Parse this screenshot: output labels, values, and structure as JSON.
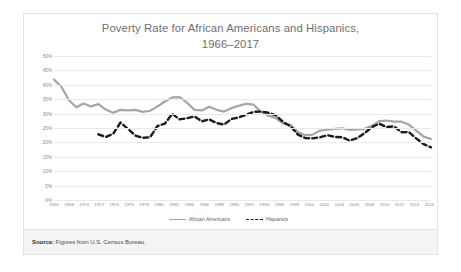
{
  "figure": {
    "title_line1": "Poverty Rate for African Americans and Hispanics,",
    "title_line2": "1966–2017",
    "source_label": "Source:",
    "source_text": " Figures from U.S. Census Bureau."
  },
  "colors": {
    "african_american_line": "#a6a6a6",
    "hispanic_line": "#1a1a1a",
    "gridline": "#e9e9e9",
    "axis_text": "#8a8a8a",
    "title_text": "#6f6f6f",
    "card_border": "#e3e3e3",
    "source_bar_bg": "#f4f4f4"
  },
  "chart_data": {
    "type": "line",
    "title": "Poverty Rate for African Americans and Hispanics, 1966–2017",
    "xlabel": "",
    "ylabel": "",
    "ylim": [
      0,
      50
    ],
    "yticks": [
      0,
      5,
      10,
      15,
      20,
      25,
      30,
      35,
      40,
      45,
      50
    ],
    "ytick_labels": [
      "0%",
      "5%",
      "10%",
      "15%",
      "20%",
      "25%",
      "30%",
      "35%",
      "40%",
      "45%",
      "50%"
    ],
    "xlim": [
      1966,
      2017
    ],
    "xticks": [
      1966,
      1968,
      1970,
      1972,
      1974,
      1976,
      1978,
      1980,
      1982,
      1984,
      1986,
      1988,
      1990,
      1992,
      1994,
      1996,
      1998,
      2000,
      2002,
      2004,
      2006,
      2008,
      2010,
      2012,
      2014,
      2016
    ],
    "xtick_labels": [
      "1966",
      "1968",
      "1970",
      "1972",
      "1974",
      "1976",
      "1978",
      "1980",
      "1982",
      "1984",
      "1986",
      "1988",
      "1990",
      "1992",
      "1994",
      "1996",
      "1998",
      "2000",
      "2002",
      "2004",
      "2006",
      "2008",
      "2010",
      "2012",
      "2014",
      "2016"
    ],
    "grid": true,
    "legend_position": "bottom",
    "series": [
      {
        "name": "African Americans",
        "style": "solid",
        "color": "#a6a6a6",
        "x": [
          1966,
          1967,
          1968,
          1969,
          1970,
          1971,
          1972,
          1973,
          1974,
          1975,
          1976,
          1977,
          1978,
          1979,
          1980,
          1981,
          1982,
          1983,
          1984,
          1985,
          1986,
          1987,
          1988,
          1989,
          1990,
          1991,
          1992,
          1993,
          1994,
          1995,
          1996,
          1997,
          1998,
          1999,
          2000,
          2001,
          2002,
          2003,
          2004,
          2005,
          2006,
          2007,
          2008,
          2009,
          2010,
          2011,
          2012,
          2013,
          2014,
          2015,
          2016,
          2017
        ],
        "y": [
          41.8,
          39.3,
          34.7,
          32.2,
          33.5,
          32.5,
          33.3,
          31.4,
          30.3,
          31.3,
          31.1,
          31.3,
          30.6,
          31.0,
          32.5,
          34.2,
          35.6,
          35.7,
          33.8,
          31.3,
          31.1,
          32.4,
          31.3,
          30.7,
          31.9,
          32.7,
          33.4,
          33.1,
          30.6,
          29.3,
          28.4,
          26.5,
          26.1,
          23.6,
          22.5,
          22.7,
          24.1,
          24.4,
          24.7,
          24.9,
          24.3,
          24.5,
          24.7,
          25.8,
          27.4,
          27.6,
          27.2,
          27.2,
          26.2,
          24.1,
          22.0,
          21.2
        ]
      },
      {
        "name": "Hispanics",
        "style": "dashed",
        "color": "#1a1a1a",
        "x": [
          1972,
          1973,
          1974,
          1975,
          1976,
          1977,
          1978,
          1979,
          1980,
          1981,
          1982,
          1983,
          1984,
          1985,
          1986,
          1987,
          1988,
          1989,
          1990,
          1991,
          1992,
          1993,
          1994,
          1995,
          1996,
          1997,
          1998,
          1999,
          2000,
          2001,
          2002,
          2003,
          2004,
          2005,
          2006,
          2007,
          2008,
          2009,
          2010,
          2011,
          2012,
          2013,
          2014,
          2015,
          2016,
          2017
        ],
        "y": [
          22.8,
          21.9,
          23.0,
          26.9,
          24.7,
          22.4,
          21.6,
          21.8,
          25.7,
          26.5,
          29.9,
          28.0,
          28.4,
          29.0,
          27.3,
          28.0,
          26.7,
          26.2,
          28.1,
          28.7,
          29.6,
          30.6,
          30.7,
          30.3,
          29.4,
          27.1,
          25.6,
          22.7,
          21.5,
          21.4,
          21.8,
          22.5,
          21.9,
          21.8,
          20.6,
          21.5,
          23.2,
          25.3,
          26.5,
          25.3,
          25.6,
          23.5,
          23.6,
          21.4,
          19.4,
          18.3
        ]
      }
    ]
  }
}
